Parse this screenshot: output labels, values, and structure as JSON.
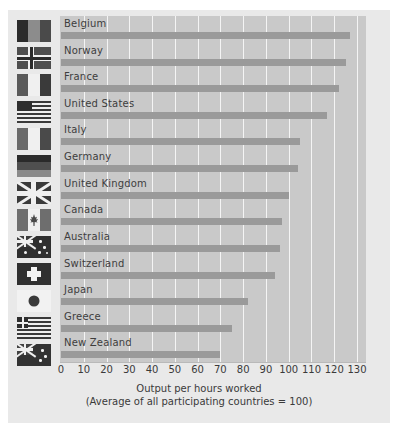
{
  "chart_data": {
    "type": "bar",
    "orientation": "horizontal",
    "title": "",
    "xlabel": "Output per hours worked",
    "xlabel_note": "(Average of all participating countries = 100)",
    "ylabel": "",
    "xlim": [
      0,
      130
    ],
    "xticks": [
      "0",
      "10",
      "20",
      "30",
      "40",
      "50",
      "60",
      "70",
      "80",
      "90",
      "100",
      "110",
      "120",
      "130"
    ],
    "grid": true,
    "legend": "none",
    "categories": [
      "Belgium",
      "Norway",
      "France",
      "United States",
      "Italy",
      "Germany",
      "United Kingdom",
      "Canada",
      "Australia",
      "Switzerland",
      "Japan",
      "Greece",
      "New Zealand"
    ],
    "values": [
      127,
      125,
      122,
      117,
      105,
      104,
      100,
      97,
      96,
      94,
      82,
      75,
      70
    ],
    "flags": [
      "belgium-flag",
      "norway-flag",
      "france-flag",
      "united-states-flag",
      "italy-flag",
      "germany-flag",
      "united-kingdom-flag",
      "canada-flag",
      "australia-flag",
      "switzerland-flag",
      "japan-flag",
      "greece-flag",
      "new-zealand-flag"
    ]
  },
  "colors": {
    "panel": "#e9e9e9",
    "plot_background": "#c9c9c9",
    "bar": "#9a9a9a",
    "gridline": "#f4f4f4",
    "text": "#3a3a3a"
  }
}
